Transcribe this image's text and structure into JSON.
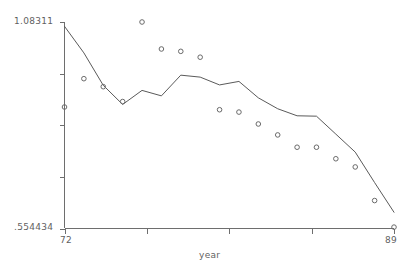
{
  "chart_data": {
    "type": "scatter",
    "title": "",
    "xlabel": "year",
    "ylabel": "",
    "grid": false,
    "legend": "none",
    "xlim": [
      72,
      89
    ],
    "ylim": [
      0.554434,
      1.08311
    ],
    "x_tick_labels": [
      "72",
      "89"
    ],
    "y_tick_labels": [
      "1.08311",
      ".554434"
    ],
    "y_tick_count": 5,
    "x_tick_count": 5,
    "x": [
      72,
      73,
      74,
      75,
      76,
      77,
      78,
      79,
      80,
      81,
      82,
      83,
      84,
      85,
      86,
      87,
      88,
      89
    ],
    "series": [
      {
        "name": "observed",
        "type": "scatter",
        "marker": "circle",
        "values": [
          0.8655,
          0.938,
          0.9175,
          0.8795,
          1.0831,
          1.014,
          1.008,
          0.993,
          0.8585,
          0.8525,
          0.822,
          0.794,
          0.7625,
          0.7625,
          0.733,
          0.712,
          0.626,
          0.558
        ]
      },
      {
        "name": "fitted",
        "type": "line",
        "values": [
          1.072,
          1.004,
          0.921,
          0.872,
          0.908,
          0.894,
          0.947,
          0.942,
          0.922,
          0.931,
          0.889,
          0.861,
          0.843,
          0.842,
          0.796,
          0.75,
          0.672,
          0.596
        ]
      }
    ]
  },
  "axis": {
    "x_title": "year",
    "x_min_label": "72",
    "x_max_label": "89",
    "y_max_label": "1.08311",
    "y_min_label": ".554434"
  },
  "colors": {
    "axis": "#6e6e6e",
    "line": "#5a5a5a",
    "marker": "#6a6a6a",
    "text": "#5f5f5f",
    "background": "#ffffff"
  }
}
